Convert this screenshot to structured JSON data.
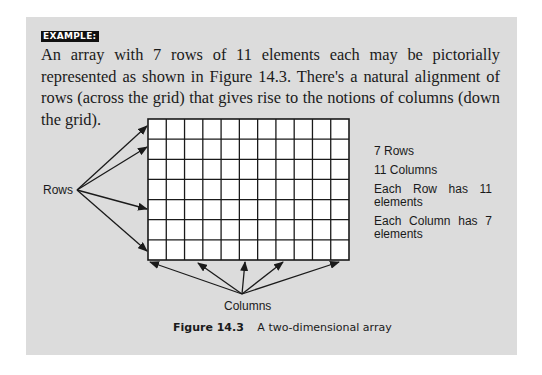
{
  "example_box": {
    "label": "EXAMPLE:",
    "paragraph": "An array with 7 rows of 11 elements each may be pictorially represented as shown in Figure 14.3. There's a natural alignment of rows (across the grid) that gives rise to the notions of columns (down the grid)."
  },
  "figure": {
    "grid": {
      "rows": 7,
      "columns": 11
    },
    "rows_label": "Rows",
    "columns_label": "Columns",
    "facts": [
      {
        "line1": "7 Rows",
        "line2": ""
      },
      {
        "line1": "11 Columns",
        "line2": ""
      },
      {
        "line1": "Each Row has 11",
        "line2": "elements"
      },
      {
        "line1": "Each Column has 7",
        "line2": "elements"
      }
    ],
    "caption_number": "Figure 14.3",
    "caption_text": "A two-dimensional array"
  },
  "colors": {
    "panel_background": "#dcdcdc",
    "grid_fill": "#ffffff",
    "line": "#1a1a1a"
  }
}
